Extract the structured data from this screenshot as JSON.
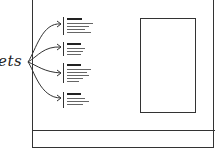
{
  "diagram": {
    "type": "wireframe-sketch",
    "label": "ets",
    "label_full_guess_hidden": false,
    "snippets": [
      {
        "title_width": 15,
        "lines": [
          26,
          22,
          18
        ]
      },
      {
        "title_width": 14,
        "lines": [
          18,
          16,
          14
        ]
      },
      {
        "title_width": 14,
        "lines": [
          24,
          20,
          22,
          16
        ]
      },
      {
        "title_width": 14,
        "lines": [
          18,
          22,
          16
        ]
      }
    ],
    "regions": [
      "main-frame",
      "snippet-list",
      "image-placeholder",
      "footer-bar"
    ],
    "colors": {
      "stroke": "#333333",
      "background": "#ffffff"
    }
  }
}
